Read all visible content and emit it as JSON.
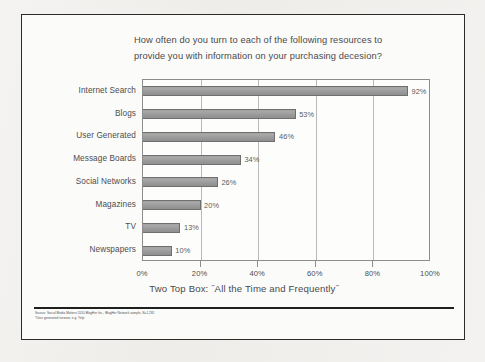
{
  "chart_data": {
    "type": "bar",
    "orientation": "horizontal",
    "title": "How often do you turn to each of the following resources to provide you with information on your purchasing decesion?",
    "title_lines": [
      "How often do you turn to each of the following resources to",
      "provide you with information on your purchasing decesion?"
    ],
    "categories": [
      "Internet Search",
      "Blogs",
      "User Generated",
      "Message Boards",
      "Social Networks",
      "Magazines",
      "TV",
      "Newspapers"
    ],
    "values": [
      92,
      53,
      46,
      34,
      26,
      20,
      13,
      10
    ],
    "value_labels": [
      "92%",
      "53%",
      "46%",
      "34%",
      "26%",
      "20%",
      "13%",
      "10%"
    ],
    "xlabel": "",
    "ylabel": "",
    "xlim": [
      0,
      100
    ],
    "xticks": [
      0,
      20,
      40,
      60,
      80,
      100
    ],
    "xtick_labels": [
      "0%",
      "20%",
      "40%",
      "60%",
      "80%",
      "100%"
    ],
    "grid": true,
    "grid_axis": "x",
    "legend": false,
    "bar_color": "#9b9b9b",
    "bar_edge_color": "#6f6f6f",
    "caption": "Two Top Box: ˝All the Time and Frequently˝"
  },
  "footnote": {
    "lines": [
      "Source: Social Media Matters 2010 BlogHer Inc., BlogHer Network sample, N=1,281",
      "*User generated reviews, e.g. Yelp"
    ]
  },
  "colors": {
    "frame": "#2b2b2b",
    "page_background": "#f2f1ef",
    "slide_background": "#fbfbfa",
    "text": "#4a4a4a",
    "gridline": "#b9b9b9"
  }
}
